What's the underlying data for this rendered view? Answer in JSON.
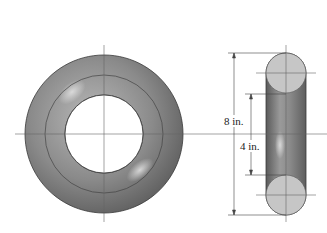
{
  "figure": {
    "dimensions": {
      "outer_diameter_label": "8 in.",
      "inner_diameter_label": "4 in."
    },
    "colors": {
      "body_dark": "#6e6e6e",
      "body_light": "#bdbdbd",
      "section_fill": "#c4c4c4",
      "line": "#444444"
    }
  }
}
